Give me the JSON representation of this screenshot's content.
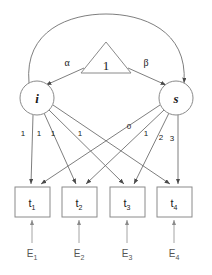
{
  "diagram": {
    "type": "sem-path-diagram",
    "colors": {
      "background": "#ffffff",
      "node_stroke": "#8a8a8a",
      "path_stroke": "#6f6f6f",
      "error_stroke": "#9a9a9a",
      "text": "#1a1a1a",
      "error_text": "#555555"
    },
    "constant": {
      "label": "1",
      "shape": "triangle"
    },
    "latents": [
      {
        "id": "i",
        "label": "i",
        "shape": "circle",
        "cx": 37,
        "cy": 98,
        "r": 17
      },
      {
        "id": "s",
        "label": "s",
        "shape": "circle",
        "cx": 176,
        "cy": 98,
        "r": 17
      }
    ],
    "mean_paths": [
      {
        "from": "1",
        "to": "i",
        "label": "α"
      },
      {
        "from": "1",
        "to": "s",
        "label": "β"
      }
    ],
    "covariance": {
      "from": "i",
      "to": "s",
      "label": "",
      "style": "double-headed-arc"
    },
    "observed": [
      {
        "id": "t1",
        "label": "t",
        "sub": "1",
        "x": 15,
        "y": 187,
        "w": 35,
        "h": 30
      },
      {
        "id": "t2",
        "label": "t",
        "sub": "2",
        "x": 62,
        "y": 187,
        "w": 35,
        "h": 30
      },
      {
        "id": "t3",
        "label": "t",
        "sub": "3",
        "x": 110,
        "y": 187,
        "w": 35,
        "h": 30
      },
      {
        "id": "t4",
        "label": "t",
        "sub": "4",
        "x": 157,
        "y": 187,
        "w": 35,
        "h": 30
      }
    ],
    "errors": [
      {
        "id": "E1",
        "label": "E",
        "sub": "1",
        "target": "t1"
      },
      {
        "id": "E2",
        "label": "E",
        "sub": "2",
        "target": "t2"
      },
      {
        "id": "E3",
        "label": "E",
        "sub": "3",
        "target": "t3"
      },
      {
        "id": "E4",
        "label": "E",
        "sub": "4",
        "target": "t4"
      }
    ],
    "intercept_loadings": [
      {
        "from": "i",
        "to": "t1",
        "label": "1"
      },
      {
        "from": "i",
        "to": "t2",
        "label": "1"
      },
      {
        "from": "i",
        "to": "t3",
        "label": "1"
      },
      {
        "from": "i",
        "to": "t4",
        "label": "1"
      }
    ],
    "slope_loadings": [
      {
        "from": "s",
        "to": "t1",
        "label": "0"
      },
      {
        "from": "s",
        "to": "t2",
        "label": "1"
      },
      {
        "from": "s",
        "to": "t3",
        "label": "2"
      },
      {
        "from": "s",
        "to": "t4",
        "label": "3"
      }
    ]
  }
}
